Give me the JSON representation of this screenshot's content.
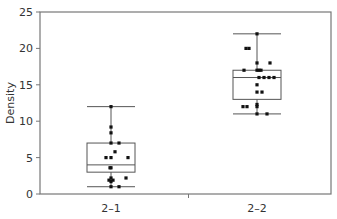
{
  "chart_data": {
    "type": "box",
    "title": "",
    "xlabel": "",
    "ylabel": "Density",
    "ylim": [
      0,
      25
    ],
    "yticks": [
      0,
      5,
      10,
      15,
      20,
      25
    ],
    "grid": false,
    "categories": [
      "2–1",
      "2–2"
    ],
    "series": [
      {
        "name": "2–1",
        "whisker_low": 1,
        "q1": 3,
        "median": 4,
        "q3": 7,
        "whisker_high": 12,
        "points": [
          {
            "dx": 0,
            "y": 12
          },
          {
            "dx": 0,
            "y": 9.2
          },
          {
            "dx": 0,
            "y": 8.4
          },
          {
            "dx": 0,
            "y": 7
          },
          {
            "dx": 8,
            "y": 7
          },
          {
            "dx": 4,
            "y": 5.8
          },
          {
            "dx": -5,
            "y": 5
          },
          {
            "dx": 0,
            "y": 5
          },
          {
            "dx": 17,
            "y": 5
          },
          {
            "dx": 0,
            "y": 3.6
          },
          {
            "dx": -1,
            "y": 3.6
          },
          {
            "dx": 0,
            "y": 2.2
          },
          {
            "dx": 15,
            "y": 2.2
          },
          {
            "dx": -2,
            "y": 1.9
          },
          {
            "dx": 2,
            "y": 1.9
          },
          {
            "dx": 0,
            "y": 1.7
          },
          {
            "dx": 0,
            "y": 1
          },
          {
            "dx": 8,
            "y": 1
          }
        ]
      },
      {
        "name": "2–2",
        "whisker_low": 11,
        "q1": 13,
        "median": 16,
        "q3": 17,
        "whisker_high": 22,
        "points": [
          {
            "dx": 0,
            "y": 22
          },
          {
            "dx": -11,
            "y": 20
          },
          {
            "dx": -8,
            "y": 20
          },
          {
            "dx": 0,
            "y": 18
          },
          {
            "dx": 13,
            "y": 18
          },
          {
            "dx": -13,
            "y": 17
          },
          {
            "dx": 0,
            "y": 17
          },
          {
            "dx": 2,
            "y": 17
          },
          {
            "dx": 4,
            "y": 17
          },
          {
            "dx": 2,
            "y": 16
          },
          {
            "dx": 7,
            "y": 16
          },
          {
            "dx": 12,
            "y": 16
          },
          {
            "dx": 17,
            "y": 16
          },
          {
            "dx": 0,
            "y": 15
          },
          {
            "dx": 0,
            "y": 14
          },
          {
            "dx": 5,
            "y": 14
          },
          {
            "dx": 0,
            "y": 12.3
          },
          {
            "dx": -14,
            "y": 12
          },
          {
            "dx": -10,
            "y": 12
          },
          {
            "dx": 0,
            "y": 12
          },
          {
            "dx": 0,
            "y": 11
          },
          {
            "dx": 10,
            "y": 11
          }
        ]
      }
    ]
  }
}
